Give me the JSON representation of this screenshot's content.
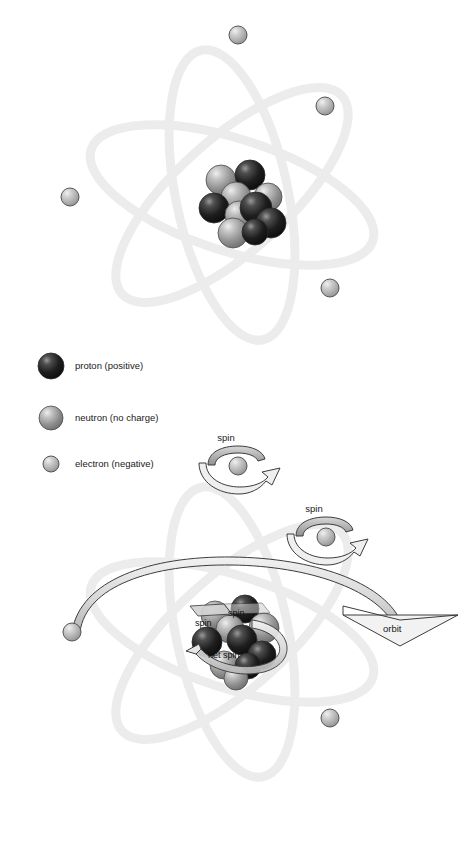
{
  "diagram": {
    "background_color": "#ffffff"
  },
  "colors": {
    "proton": "#1d1d1d",
    "proton_highlight": "#8f8f8f",
    "neutron": "#9b9b9b",
    "neutron_highlight": "#e8e8e8",
    "electron": "#b4b4b4",
    "electron_highlight": "#ececec",
    "sphere_outline": "#3a3a3a",
    "orbit_ring": "#ededed",
    "ribbon_fill": "#b9b9b9",
    "ribbon_fill_light": "#dcdcdc",
    "ribbon_outline": "#3c3c3c",
    "label_text": "#1a1a1a"
  },
  "legend": {
    "items": [
      {
        "key": "proton",
        "label": "proton (positive)",
        "swatch": "proton-sphere",
        "radius": 13
      },
      {
        "key": "neutron",
        "label": "neutron (no charge)",
        "swatch": "neutron-sphere",
        "radius": 12
      },
      {
        "key": "electron",
        "label": "electron (negative)",
        "swatch": "electron-sphere",
        "radius": 8
      }
    ]
  },
  "top_atom": {
    "name": "classical atom model",
    "orbit_count": 3,
    "electron_count": 4,
    "nucleus_particle_count": 10,
    "nucleus_protons": 5,
    "nucleus_neutrons": 5
  },
  "bottom_atom": {
    "name": "atom with spin and orbit annotations",
    "orbit_count": 3,
    "electron_count": 4,
    "nucleus_particle_count": 10,
    "labels": {
      "spin_top": "spin",
      "spin_right": "spin",
      "nucleus_spin_a": "spin",
      "nucleus_spin_b": "spin",
      "net_spin": "net spin",
      "orbit": "orbit"
    }
  }
}
